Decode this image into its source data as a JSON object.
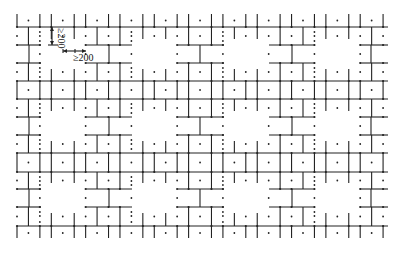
{
  "diagram": {
    "type": "brick-pattern-layout",
    "line_color": "#222222",
    "background": "#ffffff",
    "columns": {
      "x_start": 17,
      "spacing": 11.44,
      "count": 33,
      "x_end": 388
    },
    "rows_y": [
      27,
      45,
      63,
      81,
      99,
      117,
      135,
      153,
      172,
      189,
      207,
      226
    ],
    "top_tick_y": 14,
    "bottom_tick_y": 238,
    "full_rows": [
      0,
      3,
      4,
      7,
      8,
      11
    ],
    "partial_rows": [
      1,
      2,
      5,
      6,
      9,
      10
    ],
    "partial_segments_x": [
      [
        17,
        41
      ],
      [
        86,
        132
      ],
      [
        178,
        224
      ],
      [
        269,
        315
      ],
      [
        360,
        388
      ]
    ],
    "gap_verticals_x": [
      29,
      109,
      200,
      292,
      371
    ],
    "annotations": [
      {
        "label": "≥200",
        "orientation": "vertical",
        "x": 58,
        "y": 36
      },
      {
        "label": "≥200",
        "orientation": "horizontal",
        "x": 73,
        "y": 57
      }
    ]
  }
}
